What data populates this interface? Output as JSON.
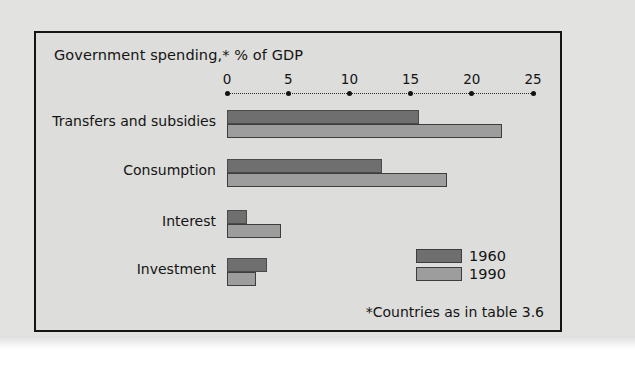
{
  "figure": {
    "title": "Government spending,* % of GDP",
    "footnote": "*Countries as in table 3.6"
  },
  "legend": {
    "entries": [
      {
        "label": "1960",
        "color": "#6f6f6f"
      },
      {
        "label": "1990",
        "color": "#9d9d9d"
      }
    ]
  },
  "chart_data": {
    "type": "bar",
    "orientation": "horizontal",
    "title": "Government spending,* % of GDP",
    "xlabel": "",
    "ylabel": "",
    "xlim": [
      0,
      25
    ],
    "xticks": [
      0,
      5,
      10,
      15,
      20,
      25
    ],
    "xtick_labels": [
      "0",
      "5",
      "10",
      "15",
      "20",
      "25"
    ],
    "grid": false,
    "legend_position": "bottom-right",
    "annotation": "*Countries as in table 3.6",
    "categories": [
      "Transfers and subsidies",
      "Consumption",
      "Interest",
      "Investment"
    ],
    "series": [
      {
        "name": "1960",
        "color": "#6f6f6f",
        "values": [
          15.7,
          12.7,
          1.6,
          3.3
        ]
      },
      {
        "name": "1990",
        "color": "#9d9d9d",
        "values": [
          22.5,
          18.0,
          4.4,
          2.4
        ]
      }
    ]
  }
}
